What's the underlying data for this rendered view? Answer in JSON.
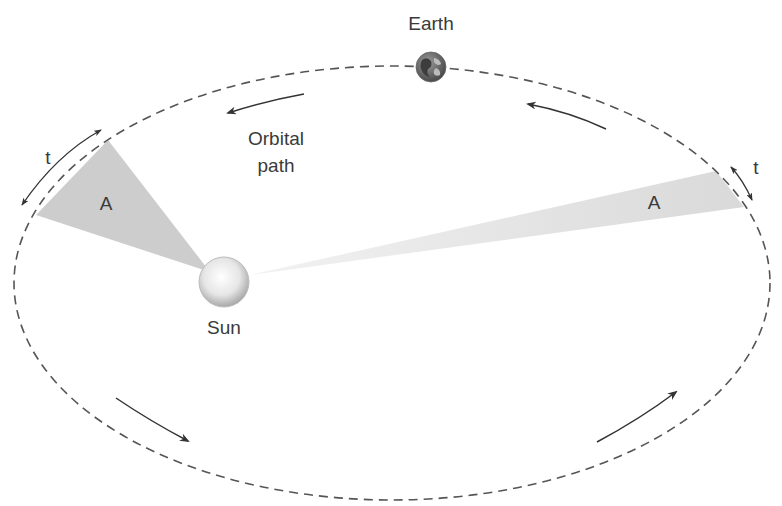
{
  "diagram": {
    "labels": {
      "earth": "Earth",
      "sun": "Sun",
      "orbital_path_line1": "Orbital",
      "orbital_path_line2": "path",
      "area_left": "A",
      "area_right": "A",
      "time_left": "t",
      "time_right": "t"
    },
    "icons": [
      "earth-globe-icon",
      "sun-sphere-icon",
      "direction-arrow-icon"
    ],
    "colors": {
      "orbit": "#555555",
      "text": "#3a3a3a",
      "area_fill": "#c8c8c8",
      "arrow": "#333333"
    }
  }
}
